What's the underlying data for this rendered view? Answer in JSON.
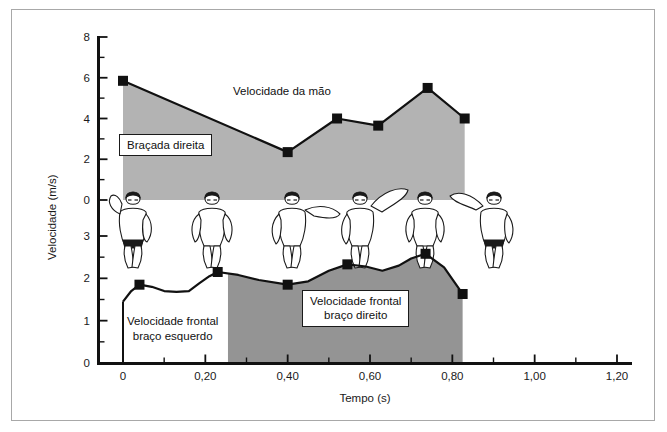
{
  "figure": {
    "border_color": "#a8a8a8",
    "background": "#ffffff"
  },
  "chart_data": {
    "type": "area",
    "title": "",
    "xlabel": "Tempo (s)",
    "ylabel": "Velocidade (m/s)",
    "grid": false,
    "legend_position": "inline-annotations",
    "colors": {
      "hand_fill": "#b3b3b3",
      "front_left_fill": "#ffffff",
      "front_right_fill": "#949494",
      "line": "#111111",
      "marker": "#111111"
    },
    "x_axis": {
      "label": "Tempo (s)",
      "min": 0,
      "max": 1.2,
      "major_ticks": [
        0,
        0.2,
        0.4,
        0.6,
        0.8,
        1.0,
        1.2
      ],
      "major_tick_labels": [
        "0",
        "0,20",
        "0,40",
        "0,60",
        "0,80",
        "1,00",
        "1,20"
      ],
      "minor_tick_step": 0.1
    },
    "y_axis_upper": {
      "label": "Velocidade (m/s)",
      "min": 0,
      "max": 8,
      "major_ticks": [
        0,
        2,
        4,
        6,
        8
      ],
      "major_tick_labels": [
        "0",
        "2",
        "4",
        "6",
        "8"
      ],
      "minor_tick_step": 1
    },
    "y_axis_lower": {
      "label": "Velocidade (m/s)",
      "min": 0,
      "max": 3,
      "major_ticks": [
        0,
        1,
        2,
        3
      ],
      "major_tick_labels": [
        "0",
        "1",
        "2",
        "3"
      ],
      "minor_tick_step": 0.5,
      "top_label": "0"
    },
    "series": [
      {
        "name": "Velocidade da mão",
        "axis": "upper",
        "units": "m/s",
        "marker_points": [
          {
            "t": 0.0,
            "v": 5.85
          },
          {
            "t": 0.4,
            "v": 2.35
          },
          {
            "t": 0.52,
            "v": 4.0
          },
          {
            "t": 0.62,
            "v": 3.65
          },
          {
            "t": 0.74,
            "v": 5.5
          },
          {
            "t": 0.83,
            "v": 4.0
          }
        ]
      },
      {
        "name": "Velocidade frontal",
        "axis": "lower",
        "units": "m/s",
        "marker_points": [
          {
            "t": 0.04,
            "v": 1.85
          },
          {
            "t": 0.23,
            "v": 2.15
          },
          {
            "t": 0.4,
            "v": 1.85
          },
          {
            "t": 0.545,
            "v": 2.33
          },
          {
            "t": 0.735,
            "v": 2.58
          },
          {
            "t": 0.825,
            "v": 1.63
          }
        ],
        "detail_points": [
          {
            "t": 0.0,
            "v": 1.45
          },
          {
            "t": 0.02,
            "v": 1.7
          },
          {
            "t": 0.04,
            "v": 1.85
          },
          {
            "t": 0.07,
            "v": 1.8
          },
          {
            "t": 0.1,
            "v": 1.7
          },
          {
            "t": 0.13,
            "v": 1.68
          },
          {
            "t": 0.16,
            "v": 1.7
          },
          {
            "t": 0.185,
            "v": 1.88
          },
          {
            "t": 0.21,
            "v": 2.05
          },
          {
            "t": 0.23,
            "v": 2.15
          },
          {
            "t": 0.28,
            "v": 2.08
          },
          {
            "t": 0.33,
            "v": 1.96
          },
          {
            "t": 0.4,
            "v": 1.85
          },
          {
            "t": 0.45,
            "v": 1.93
          },
          {
            "t": 0.5,
            "v": 2.18
          },
          {
            "t": 0.545,
            "v": 2.33
          },
          {
            "t": 0.59,
            "v": 2.28
          },
          {
            "t": 0.63,
            "v": 2.18
          },
          {
            "t": 0.67,
            "v": 2.3
          },
          {
            "t": 0.7,
            "v": 2.47
          },
          {
            "t": 0.735,
            "v": 2.58
          },
          {
            "t": 0.78,
            "v": 2.26
          },
          {
            "t": 0.825,
            "v": 1.63
          }
        ],
        "split_t": 0.255
      }
    ],
    "annotations": [
      {
        "id": "hand-label",
        "text": "Velocidade da mão",
        "boxed": false,
        "t": 0.38,
        "v_axis": "upper",
        "v": 6.9
      },
      {
        "id": "right-stroke-label",
        "text": "Braçada direita",
        "boxed": true,
        "t": 0.1,
        "v_axis": "upper",
        "v": 2.6
      },
      {
        "id": "front-left-label",
        "text": "Velocidade frontal\nbraço esquerdo",
        "boxed": false,
        "t": 0.06,
        "v_axis": "lower",
        "v": 1.05
      },
      {
        "id": "front-right-label",
        "text": "Velocidade frontal\nbraço direito",
        "boxed": true,
        "t": 0.44,
        "v_axis": "lower",
        "v": 1.45
      }
    ],
    "swimmer_sequence": {
      "count": 6,
      "description": "front-crawl stroke phases"
    }
  },
  "labels": {
    "y_axis_title": "Velocidade (m/s)",
    "x_axis_title": "Tempo (s)",
    "hand_velocity": "Velocidade da mão",
    "right_stroke": "Braçada direita",
    "front_left_line1": "Velocidade frontal",
    "front_left_line2": "braço esquerdo",
    "front_right_line1": "Velocidade frontal",
    "front_right_line2": "braço direito"
  },
  "y_ticks_upper": [
    "8",
    "6",
    "4",
    "2",
    "0"
  ],
  "y_ticks_lower": [
    "3",
    "2",
    "1",
    "0"
  ],
  "x_ticks": [
    "0",
    "0,20",
    "0,40",
    "0,60",
    "0,80",
    "1,00",
    "1,20"
  ]
}
